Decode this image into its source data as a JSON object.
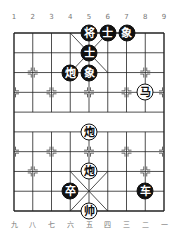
{
  "board": {
    "top_labels": [
      "1",
      "2",
      "3",
      "4",
      "5",
      "6",
      "7",
      "8",
      "9"
    ],
    "bottom_labels": [
      "九",
      "八",
      "七",
      "六",
      "五",
      "四",
      "三",
      "二",
      "一"
    ],
    "pieces": [
      {
        "char": "将",
        "side": "black",
        "file": 4,
        "rank": 0
      },
      {
        "char": "士",
        "side": "black",
        "file": 5,
        "rank": 0
      },
      {
        "char": "象",
        "side": "black",
        "file": 6,
        "rank": 0
      },
      {
        "char": "士",
        "side": "black",
        "file": 4,
        "rank": 1
      },
      {
        "char": "炮",
        "side": "black",
        "file": 3,
        "rank": 2
      },
      {
        "char": "象",
        "side": "black",
        "file": 4,
        "rank": 2
      },
      {
        "char": "马",
        "side": "red",
        "file": 7,
        "rank": 3
      },
      {
        "char": "炮",
        "side": "red",
        "file": 4,
        "rank": 5
      },
      {
        "char": "炮",
        "side": "red",
        "file": 4,
        "rank": 7
      },
      {
        "char": "卒",
        "side": "black",
        "file": 3,
        "rank": 8
      },
      {
        "char": "车",
        "side": "black",
        "file": 7,
        "rank": 8
      },
      {
        "char": "帅",
        "side": "red",
        "file": 4,
        "rank": 9
      }
    ]
  }
}
